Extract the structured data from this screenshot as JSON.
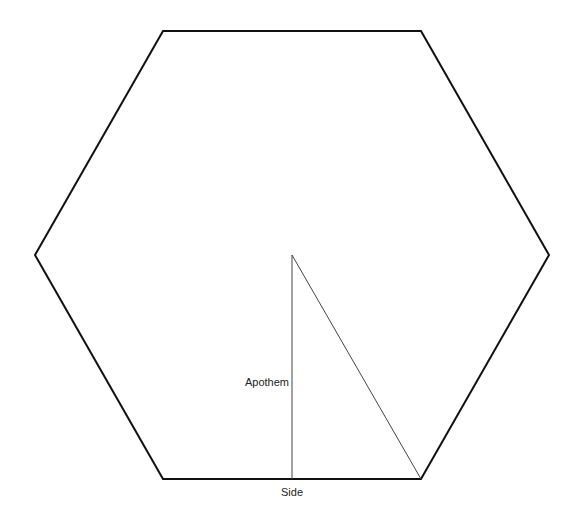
{
  "diagram": {
    "colors": {
      "background": "#ffffff",
      "outline": "#111111",
      "inner_lines": "#444444",
      "label_text": "#222222"
    },
    "hexagon": {
      "vertices": [
        [
          163,
          31
        ],
        [
          421,
          31
        ],
        [
          549,
          255
        ],
        [
          421,
          479
        ],
        [
          163,
          479
        ],
        [
          35,
          255
        ]
      ],
      "stroke_width": 2
    },
    "center": [
      292,
      255
    ],
    "apothem_line": {
      "from": [
        292,
        255
      ],
      "to": [
        292,
        479
      ],
      "stroke_width": 1
    },
    "radius_line": {
      "from": [
        292,
        255
      ],
      "to": [
        421,
        479
      ],
      "stroke_width": 1
    },
    "labels": {
      "apothem": "Apothem",
      "side": "Side"
    }
  }
}
